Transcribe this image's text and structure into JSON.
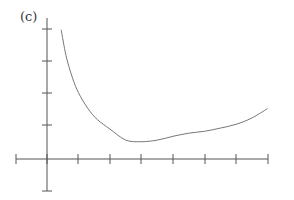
{
  "panel_label": "(c)",
  "colors": {
    "axis": "#555555",
    "curve": "#777777"
  },
  "chart_data": {
    "type": "line",
    "title": "",
    "xlabel": "",
    "ylabel": "",
    "grid": false,
    "legend": null,
    "x_ticks_px": [
      16,
      47,
      78,
      110,
      141,
      173,
      205,
      236,
      268
    ],
    "y_ticks_px": [
      29,
      61,
      93,
      125,
      191
    ],
    "axes_origin_px": [
      47,
      159
    ],
    "x_tick_spacing_units": 1,
    "xlim": [
      -1,
      7
    ],
    "ylim": [
      -1,
      4
    ],
    "series": [
      {
        "name": "curve",
        "description": "decreasing convex curve near y-axis, reaches minimum then rises slowly",
        "x": [
          0.45,
          0.6,
          0.8,
          1.0,
          1.3,
          1.6,
          2.0,
          2.5,
          3.0,
          3.5,
          4.0,
          4.5,
          5.0,
          5.5,
          6.0,
          6.5,
          7.0
        ],
        "y": [
          4.1,
          3.3,
          2.6,
          2.1,
          1.6,
          1.25,
          0.95,
          0.6,
          0.55,
          0.6,
          0.72,
          0.82,
          0.88,
          0.98,
          1.1,
          1.3,
          1.6
        ]
      }
    ]
  }
}
